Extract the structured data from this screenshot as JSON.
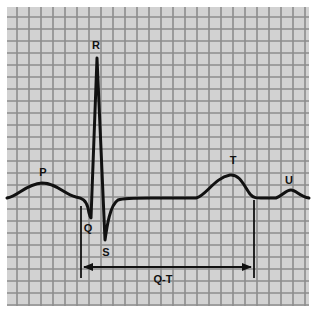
{
  "diagram": {
    "title": "",
    "type": "ECG waveform",
    "colors": {
      "paper": "#d2d2d2",
      "grid_line": "#8c8c8c",
      "trace": "#111111",
      "page": "#ffffff"
    },
    "grid": {
      "x0": 7,
      "y0": 7,
      "x1": 309,
      "y1": 306,
      "cell": 12
    },
    "labels": {
      "p": "P",
      "q": "Q",
      "r": "R",
      "s": "S",
      "t": "T",
      "u": "U",
      "qt": "Q-T"
    }
  }
}
